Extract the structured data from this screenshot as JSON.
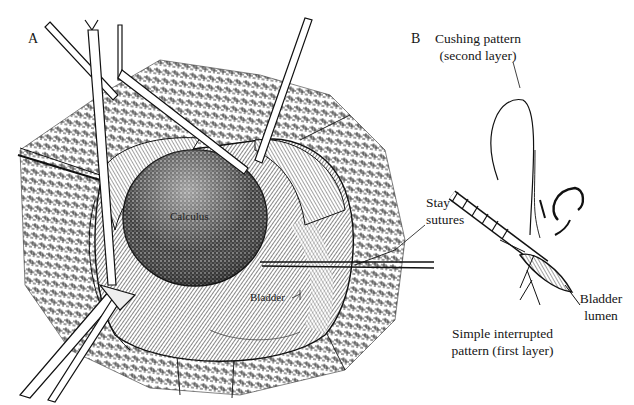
{
  "figure": {
    "panel_a": {
      "letter": "A",
      "labels": {
        "calculus": "Calculus",
        "bladder": "Bladder"
      }
    },
    "panel_b": {
      "letter": "B",
      "labels": {
        "cushing_line1": "Cushing pattern",
        "cushing_line2": "(second layer)",
        "stay_line1": "Stay",
        "stay_line2": "sutures",
        "bladder_lumen_line1": "Bladder",
        "bladder_lumen_line2": "lumen",
        "simple_line1": "Simple interrupted",
        "simple_line2": "pattern (first layer)"
      }
    },
    "colors": {
      "ink": "#111111",
      "background": "#ffffff"
    }
  }
}
